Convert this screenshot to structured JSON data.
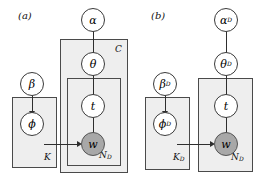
{
  "figure": {
    "background_color": "#ffffff",
    "plate_fill_color": "#eeeeee",
    "plate_border_color": "#4a4a4a",
    "node_fill_color": "#ffffff",
    "observed_node_fill_color": "#a8a8a8",
    "edge_color": "#2e2e2e"
  },
  "panel_a": {
    "label": "(a)",
    "nodes": {
      "alpha": "α",
      "theta": "θ",
      "t": "t",
      "w": "w",
      "beta": "β",
      "phi": "ϕ"
    },
    "plates": {
      "outer": "C",
      "inner": "N",
      "inner_sub": "D",
      "topic": "K"
    }
  },
  "panel_b": {
    "label": "(b)",
    "nodes": {
      "alpha": "α",
      "alpha_sub": "D",
      "theta": "θ",
      "theta_sub": "D",
      "t": "t",
      "w": "w",
      "beta": "β",
      "beta_sub": "D",
      "phi": "ϕ",
      "phi_sub": "D"
    },
    "plates": {
      "doc": "N",
      "doc_sub": "D",
      "topic": "K",
      "topic_sub": "D"
    }
  }
}
